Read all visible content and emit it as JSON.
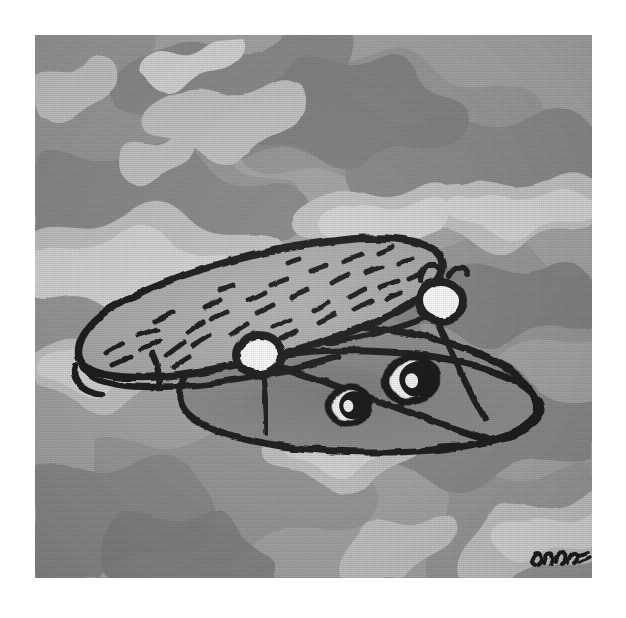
{
  "artwork": {
    "title": "Camouflage Cap with Eyes",
    "medium_note": "ink and gouache illustration on camouflage ground",
    "signature": "Dopa",
    "plate": {
      "left": 35,
      "top": 35,
      "width": 557,
      "height": 543
    },
    "paper_color": "#ffffff"
  },
  "palette": {
    "paper": "#ffffff",
    "camo_base": "#a7a7a7",
    "camo_mid": "#9a9a9a",
    "camo_dark": "#8c8c8c",
    "camo_darkest": "#828282",
    "camo_light": "#c2c2c2",
    "camo_lightest": "#d6d6d6",
    "ink": "#1a1a1a",
    "brim_fill": "#b0b0b0",
    "crown_fill": "#8f8f8f",
    "crown_shadow": "#848484",
    "button_fill": "#ffffff",
    "eye_white": "#f7f7f7",
    "eye_pupil": "#141414"
  },
  "subject": {
    "name": "camouflage cap",
    "parts": [
      {
        "id": "crown",
        "label": "cap crown",
        "fill": "#8f8f8f"
      },
      {
        "id": "brim",
        "label": "cap brim",
        "fill": "#b0b0b0"
      },
      {
        "id": "band",
        "label": "cap band loop",
        "fill": "none"
      },
      {
        "id": "button-left",
        "label": "left white button",
        "fill": "#ffffff"
      },
      {
        "id": "button-right",
        "label": "right white button",
        "fill": "#ffffff"
      },
      {
        "id": "eye-left",
        "label": "left eye",
        "fill": "#f7f7f7"
      },
      {
        "id": "eye-right",
        "label": "right eye",
        "fill": "#f7f7f7"
      }
    ],
    "brim_dash_count": 34,
    "eye_count": 2,
    "button_count": 2
  },
  "camo_blobs": {
    "light_count": 18,
    "dark_count": 16,
    "description": "irregular woodland camouflage blobs in four grey values"
  }
}
